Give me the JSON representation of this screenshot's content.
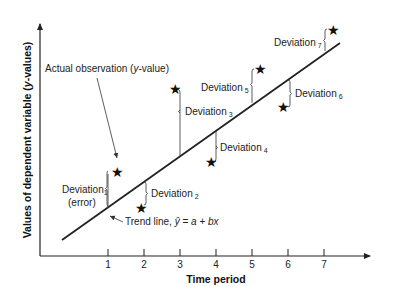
{
  "diagram": {
    "y_axis_label": "Values of dependent variable (y-values)",
    "y_axis_label_parts": {
      "a": "Values of dependent variable (",
      "b": "y",
      "c": "-values)"
    },
    "x_axis_label": "Time period",
    "x_ticks": [
      "1",
      "2",
      "3",
      "4",
      "5",
      "6",
      "7"
    ],
    "actual_observation_label": {
      "a": "Actual observation (",
      "b": "y",
      "c": "-value)"
    },
    "trend_line_label": {
      "a": "Trend line, ",
      "yhat": "ŷ",
      "eq": " = ",
      "a_var": "a",
      "plus": " + ",
      "bx": "bx"
    },
    "deviations": [
      {
        "word": "Deviation",
        "sub": "1",
        "extra": "(error)"
      },
      {
        "word": "Deviation",
        "sub": "2"
      },
      {
        "word": "Deviation",
        "sub": "3"
      },
      {
        "word": "Deviation",
        "sub": "4"
      },
      {
        "word": "Deviation",
        "sub": "5"
      },
      {
        "word": "Deviation",
        "sub": "6"
      },
      {
        "word": "Deviation",
        "sub": "7"
      }
    ],
    "star_glyph": "★",
    "colors": {
      "line": "#222222",
      "text": "#222222",
      "background": "#ffffff"
    }
  }
}
